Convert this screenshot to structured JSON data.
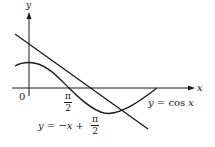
{
  "figure": {
    "axes": {
      "x_label": "x",
      "y_label": "y",
      "origin_label": "0",
      "tick_label": {
        "numerator": "π",
        "denominator": "2"
      }
    },
    "curves": [
      {
        "name": "cosine",
        "label_prefix": "y = cos ",
        "label_var": "x"
      },
      {
        "name": "tangent-line",
        "label_prefix": "y = −",
        "label_var": "x",
        "label_suffix": " + ",
        "frac_num": "π",
        "frac_den": "2"
      }
    ],
    "colors": {
      "ink": "#1a1a1a",
      "background": "#ffffff"
    }
  }
}
